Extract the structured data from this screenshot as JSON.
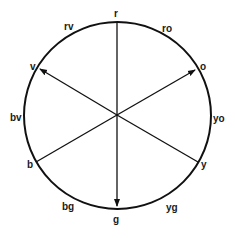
{
  "diagram": {
    "type": "color-wheel",
    "center": [
      117,
      115
    ],
    "radius": 93,
    "stroke_color": "#111111",
    "labels": {
      "r": "r",
      "ro": "ro",
      "o": "o",
      "yo": "yo",
      "y": "y",
      "yg": "yg",
      "g": "g",
      "bg": "bg",
      "b": "b",
      "bv": "bv",
      "v": "v",
      "rv": "rv"
    },
    "spokes": [
      {
        "to": "r",
        "arrow": false
      },
      {
        "to": "o",
        "arrow": true
      },
      {
        "to": "y",
        "arrow": false
      },
      {
        "to": "g",
        "arrow": true
      },
      {
        "to": "b",
        "arrow": false
      },
      {
        "to": "v",
        "arrow": true
      }
    ]
  }
}
